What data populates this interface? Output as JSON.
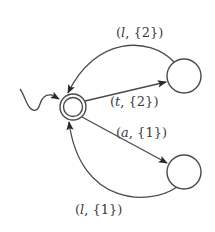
{
  "diagram": {
    "type": "automaton",
    "colors": {
      "stroke": "#4a4a4a",
      "text": "#3a3a3a",
      "background": "#ffffff"
    },
    "states": [
      {
        "id": "q0",
        "initial": true,
        "accepting": true,
        "cx": 73,
        "cy": 107
      },
      {
        "id": "q1",
        "initial": false,
        "accepting": false,
        "cx": 184,
        "cy": 76
      },
      {
        "id": "q2",
        "initial": false,
        "accepting": false,
        "cx": 184,
        "cy": 172
      }
    ],
    "transitions": [
      {
        "from": "q1",
        "to": "q0",
        "symbol": "l",
        "set": "{2}",
        "label": "(l, {2})"
      },
      {
        "from": "q0",
        "to": "q1",
        "symbol": "t",
        "set": "{2}",
        "label": "(t, {2})"
      },
      {
        "from": "q0",
        "to": "q2",
        "symbol": "a",
        "set": "{1}",
        "label": "(a, {1})"
      },
      {
        "from": "q2",
        "to": "q0",
        "symbol": "l",
        "set": "{1}",
        "label": "(l, {1})"
      }
    ],
    "labels": {
      "top_arc": {
        "open": "(",
        "sym": "l",
        "rest": ", {2})"
      },
      "t_edge": {
        "open": "(",
        "sym": "t",
        "rest": ", {2})"
      },
      "a_edge": {
        "open": "(",
        "sym": "a",
        "rest": ", {1})"
      },
      "bottom_arc": {
        "open": "(",
        "sym": "l",
        "rest": ", {1})"
      }
    }
  }
}
